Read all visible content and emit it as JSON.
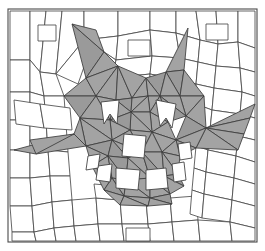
{
  "artwork": {
    "title": "Low-poly mosaic cat face",
    "subject": "cat-head",
    "style": "low-poly-mosaic",
    "canvas": {
      "width": 265,
      "height": 251
    },
    "frame": {
      "x": 8,
      "y": 9,
      "width": 249,
      "height": 233,
      "stroke": "#4a4a4a",
      "stroke_width": 1.1
    },
    "palette": {
      "background": "#ffffff",
      "tile_fill": "#ffffff",
      "tile_stroke": "#4a4a4a",
      "cat_fill": "#a3a3a3",
      "cat_fill_dark": "#9a9a9a",
      "cat_stroke": "#3c3c3c",
      "feature_fill": "#ffffff"
    },
    "counts": {
      "background_tiles": 96,
      "cat_triangles": 58,
      "feature_shapes": 9,
      "whisker_wedges": 6
    },
    "features": [
      {
        "name": "left-ear",
        "fill": "#a3a3a3"
      },
      {
        "name": "right-ear",
        "fill": "#a3a3a3"
      },
      {
        "name": "left-eye",
        "fill": "#ffffff"
      },
      {
        "name": "right-eye",
        "fill": "#ffffff"
      },
      {
        "name": "nose",
        "fill": "#ffffff"
      },
      {
        "name": "mouth",
        "fill": "#ffffff"
      },
      {
        "name": "left-fang",
        "fill": "#ffffff"
      },
      {
        "name": "right-fang",
        "fill": "#ffffff"
      },
      {
        "name": "left-whiskers",
        "fill": "#a3a3a3"
      },
      {
        "name": "right-whiskers",
        "fill": "#a3a3a3"
      }
    ]
  },
  "geometry": {
    "background_tiles": [
      "10,11 30,11 30,60 10,60",
      "30,11 46,11 40,72 30,60",
      "46,11 62,11 56,74 40,72",
      "62,11 84,11 84,40 56,74",
      "84,11 118,11 118,36 84,40",
      "118,11 150,11 150,30 118,36",
      "150,11 176,11 176,33 150,30",
      "176,11 196,11 200,40 176,33",
      "196,11 216,11 218,44 200,40",
      "216,11 238,11 238,42 218,44",
      "238,11 255,11 255,48 238,42",
      "10,60 30,60 30,92 10,92",
      "30,60 40,72 44,96 30,92",
      "40,72 56,74 64,96 44,96",
      "56,74 84,40 92,44 78,84",
      "84,40 118,36 116,60 92,44",
      "118,36 150,30 152,56 116,60",
      "150,30 176,33 180,58 152,56",
      "176,33 200,40 198,62 180,58",
      "200,40 218,44 216,66 198,62",
      "218,44 238,42 240,68 216,66",
      "238,42 255,48 255,72 240,68",
      "10,92 30,92 30,120 10,120",
      "30,92 44,96 46,122 30,120",
      "44,96 64,96 66,124 46,122",
      "92,44 116,60 112,78 88,70",
      "116,60 152,56 150,74 112,78",
      "152,56 180,58 180,80 150,74",
      "180,58 198,62 196,84 180,80",
      "198,62 216,66 214,88 196,84",
      "216,66 240,68 242,92 214,88",
      "240,68 255,72 255,96 242,92",
      "10,120 30,120 30,150 10,150",
      "30,120 46,122 48,150 30,150",
      "46,122 66,124 68,152 48,150",
      "112,78 150,74 150,90 114,92",
      "150,74 180,80 178,96 150,90",
      "180,80 196,84 196,104 178,96",
      "196,84 214,88 212,110 196,104",
      "214,88 242,92 240,114 212,110",
      "242,92 255,96 255,118 240,114",
      "10,150 30,150 30,178 10,178",
      "30,150 48,150 50,176 30,178",
      "48,150 68,152 70,176 50,176",
      "196,104 212,110 210,130 196,126",
      "212,110 240,114 238,136 210,130",
      "240,114 255,118 255,140 238,136",
      "10,178 30,178 32,206 10,206",
      "30,178 50,176 52,202 32,206",
      "50,176 70,176 72,200 52,202",
      "196,126 210,130 208,150 196,146",
      "210,130 238,136 236,156 208,150",
      "238,136 255,140 255,162 236,156",
      "10,206 32,206 34,232 12,232",
      "32,206 52,202 54,228 34,232",
      "52,202 72,200 74,226 54,228",
      "74,226 72,200 96,198 98,224",
      "96,198 120,200 122,224 98,224",
      "120,200 146,200 148,224 122,224",
      "146,200 170,198 172,222 148,224",
      "170,198 196,196 198,220 172,222",
      "196,146 208,150 206,172 194,168",
      "208,150 236,156 234,178 206,172",
      "236,156 255,162 255,184 234,178",
      "194,168 206,172 204,194 192,190",
      "206,172 234,178 232,200 204,194",
      "234,178 255,184 255,206 232,200",
      "192,190 204,194 202,218 190,214",
      "204,194 232,200 230,222 202,218",
      "232,200 255,206 255,228 230,222",
      "12,232 34,232 36,241 12,241",
      "34,232 54,228 56,241 36,241",
      "54,228 74,226 76,241 56,241",
      "74,226 98,224 100,241 76,241",
      "98,224 122,224 124,241 100,241",
      "122,224 148,224 150,241 124,241",
      "148,224 172,222 174,241 150,241",
      "172,222 198,220 200,241 174,241",
      "198,220 230,222 232,241 200,241",
      "230,222 255,228 255,241 232,241",
      "96,198 120,200 118,186 94,184",
      "120,200 146,200 146,186 118,186",
      "146,200 170,198 168,184 146,186",
      "14,100 40,104 44,128 16,124",
      "40,104 70,108 72,130 44,128"
    ],
    "background_squares": [
      "38,25 56,25 56,41 38,41",
      "128,40 150,40 150,56 128,56",
      "206,24 228,24 228,40 206,40",
      "126,228 150,228 150,241 126,241"
    ],
    "cat_triangles": [
      "72,24 86,78 104,52",
      "72,24 104,52 96,30",
      "104,52 86,78 118,66",
      "86,78 64,96 96,96",
      "86,78 96,96 118,66",
      "64,96 96,96 80,118",
      "96,96 118,66 116,100",
      "96,96 116,100 110,120",
      "96,96 110,120 80,118",
      "118,66 132,98 116,100",
      "132,98 116,100 131,112",
      "116,100 110,120 131,112",
      "118,66 146,78 132,98",
      "146,78 132,98 148,96",
      "132,98 148,96 131,112",
      "146,78 166,72 160,96",
      "146,78 160,96 148,96",
      "160,96 148,96 150,112",
      "148,96 131,112 150,112",
      "166,72 188,28 184,70",
      "166,72 184,70 180,96",
      "166,72 180,96 160,96",
      "184,70 204,96 180,96",
      "180,96 204,96 186,116",
      "180,96 186,116 160,96",
      "160,96 186,116 168,122",
      "160,96 168,122 150,112",
      "150,112 168,122 152,132",
      "150,112 152,132 131,112",
      "131,112 152,132 130,130",
      "131,112 130,130 110,120",
      "110,120 130,130 112,140",
      "110,120 112,140 80,118",
      "80,118 112,140 86,146",
      "80,118 86,146 74,134",
      "86,146 112,140 108,156",
      "86,146 108,156 92,166",
      "130,130 152,132 142,152",
      "130,130 142,152 112,140",
      "112,140 142,152 128,158",
      "112,140 128,158 108,156",
      "152,132 168,122 176,140",
      "152,132 176,140 162,152",
      "152,132 162,152 142,152",
      "186,116 204,96 206,128",
      "186,116 206,128 176,140",
      "176,140 206,128 196,148",
      "176,140 196,148 180,156",
      "176,140 180,156 162,152",
      "92,166 108,156 112,178",
      "108,156 128,158 126,180",
      "108,156 126,180 112,178",
      "128,158 142,152 150,178",
      "128,158 150,178 126,180",
      "142,152 162,152 164,176",
      "142,152 164,176 150,178",
      "162,152 180,156 178,174",
      "162,152 178,174 164,176",
      "92,166 112,178 104,190",
      "112,178 126,180 124,196",
      "112,178 124,196 104,190",
      "126,180 150,178 150,198",
      "126,180 150,198 124,196",
      "150,178 164,176 170,194",
      "150,178 170,194 150,198",
      "164,176 178,174 184,186",
      "164,176 184,186 170,194",
      "104,190 124,196 120,205",
      "124,196 150,198 148,206",
      "124,196 148,206 120,205",
      "150,198 170,194 172,204",
      "150,198 172,204 148,206"
    ],
    "whisker_wedges": [
      "74,134 86,146 36,154 14,150",
      "74,134 36,154 30,140",
      "206,128 255,104 250,118",
      "206,128 250,118 244,134",
      "206,128 244,134 238,150",
      "206,128 238,150 196,148"
    ],
    "feature_shapes": [
      "101,102 119,100 117,124 110,114 104,124",
      "156,100 176,104 172,128 166,118 160,126",
      "124,134 146,136 144,158 122,156",
      "98,166 112,164 110,182 96,180",
      "116,168 140,170 138,190 116,188",
      "146,170 166,168 168,188 146,190",
      "172,164 184,162 186,180 174,182",
      "88,156 100,154 98,168 86,170",
      "178,144 190,142 192,158 180,160"
    ]
  }
}
